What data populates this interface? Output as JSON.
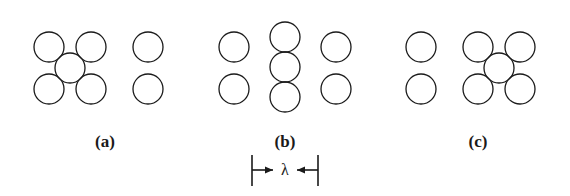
{
  "figure": {
    "background_color": "#ffffff",
    "stroke_color": "#1a1a1a",
    "circle_stroke_width": 1.3,
    "circle_radius": 15,
    "canvas": {
      "width": 570,
      "height": 196
    }
  },
  "panels": [
    {
      "id": "panel-a",
      "label": "(a)",
      "label_x": 105,
      "label_y": 141,
      "circles": [
        {
          "name": "top-left",
          "cx": 49,
          "cy": 47
        },
        {
          "name": "top-right",
          "cx": 91,
          "cy": 47
        },
        {
          "name": "center",
          "cx": 70,
          "cy": 68
        },
        {
          "name": "bottom-left",
          "cx": 49,
          "cy": 89
        },
        {
          "name": "bottom-right",
          "cx": 91,
          "cy": 89
        },
        {
          "name": "isolated-top",
          "cx": 148,
          "cy": 47
        },
        {
          "name": "isolated-bottom",
          "cx": 148,
          "cy": 89
        }
      ]
    },
    {
      "id": "panel-b",
      "label": "(b)",
      "label_x": 285,
      "label_y": 141,
      "circles": [
        {
          "name": "left-top",
          "cx": 234,
          "cy": 47
        },
        {
          "name": "left-bottom",
          "cx": 234,
          "cy": 89
        },
        {
          "name": "center-top",
          "cx": 285,
          "cy": 37
        },
        {
          "name": "center-mid",
          "cx": 285,
          "cy": 67
        },
        {
          "name": "center-bottom",
          "cx": 285,
          "cy": 97
        },
        {
          "name": "right-top",
          "cx": 336,
          "cy": 47
        },
        {
          "name": "right-bottom",
          "cx": 336,
          "cy": 89
        }
      ]
    },
    {
      "id": "panel-c",
      "label": "(c)",
      "label_x": 478,
      "label_y": 141,
      "circles": [
        {
          "name": "isolated-top",
          "cx": 421,
          "cy": 47
        },
        {
          "name": "isolated-bottom",
          "cx": 421,
          "cy": 89
        },
        {
          "name": "top-left",
          "cx": 478,
          "cy": 47
        },
        {
          "name": "top-right",
          "cx": 520,
          "cy": 47
        },
        {
          "name": "center",
          "cx": 499,
          "cy": 68
        },
        {
          "name": "bottom-left",
          "cx": 478,
          "cy": 89
        },
        {
          "name": "bottom-right",
          "cx": 520,
          "cy": 89
        }
      ]
    }
  ],
  "dimension": {
    "name": "wavelength-dimension",
    "symbol": "λ",
    "symbol_x": 285,
    "symbol_y": 170,
    "line_y": 170,
    "left_x": 252,
    "right_x": 318,
    "tick_top": 155,
    "tick_bottom": 186,
    "stroke_width": 1.6
  }
}
